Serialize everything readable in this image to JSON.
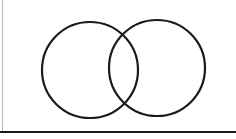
{
  "diagram": {
    "type": "venn",
    "sets": [
      {
        "name": "set-a",
        "cx": 90,
        "cy": 70,
        "r": 48
      },
      {
        "name": "set-b",
        "cx": 157,
        "cy": 68,
        "r": 48
      }
    ],
    "stroke_color": "#1a1a1a",
    "background": "#ffffff"
  }
}
